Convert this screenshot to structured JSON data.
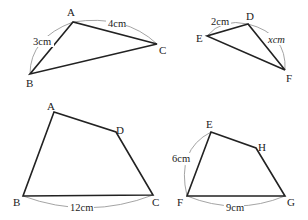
{
  "figures": [
    {
      "id": "triangle-abc",
      "type": "triangle",
      "vertices": [
        {
          "name": "A",
          "x": 73,
          "y": 22,
          "lx": 66,
          "ly": 14
        },
        {
          "name": "B",
          "x": 30,
          "y": 74,
          "lx": 25,
          "ly": 87
        },
        {
          "name": "C",
          "x": 157,
          "y": 44,
          "lx": 160,
          "ly": 53
        }
      ],
      "measures": [
        {
          "text": "3cm",
          "x": 31,
          "y": 45,
          "edge": "AB"
        },
        {
          "text": "4cm",
          "x": 108,
          "y": 28,
          "edge": "AC"
        }
      ]
    },
    {
      "id": "triangle-def",
      "type": "triangle",
      "vertices": [
        {
          "name": "D",
          "x": 248,
          "y": 24,
          "lx": 246,
          "ly": 20
        },
        {
          "name": "E",
          "x": 207,
          "y": 36,
          "lx": 196,
          "ly": 42
        },
        {
          "name": "F",
          "x": 285,
          "y": 70,
          "lx": 287,
          "ly": 81
        }
      ],
      "measures": [
        {
          "text": "2cm",
          "x": 212,
          "y": 24,
          "edge": "ED"
        },
        {
          "text": "xcm",
          "x": 269,
          "y": 43,
          "edge": "DF"
        }
      ]
    },
    {
      "id": "quadrilateral-abcd",
      "type": "quadrilateral",
      "vertices": [
        {
          "name": "A",
          "x": 54,
          "y": 112,
          "lx": 47,
          "ly": 110
        },
        {
          "name": "B",
          "x": 23,
          "y": 196,
          "lx": 13,
          "ly": 206
        },
        {
          "name": "C",
          "x": 153,
          "y": 195,
          "lx": 153,
          "ly": 206
        },
        {
          "name": "D",
          "x": 116,
          "y": 132,
          "lx": 116,
          "ly": 132
        }
      ],
      "measures": [
        {
          "text": "12cm",
          "x": 71,
          "y": 210,
          "edge": "BC"
        }
      ]
    },
    {
      "id": "quadrilateral-efgh",
      "type": "quadrilateral",
      "vertices": [
        {
          "name": "E",
          "x": 211,
          "y": 132,
          "lx": 206,
          "ly": 128
        },
        {
          "name": "F",
          "x": 187,
          "y": 196,
          "lx": 177,
          "ly": 206
        },
        {
          "name": "G",
          "x": 285,
          "y": 196,
          "lx": 288,
          "ly": 206
        },
        {
          "name": "H",
          "x": 256,
          "y": 148,
          "lx": 258,
          "ly": 149
        }
      ],
      "measures": [
        {
          "text": "6cm",
          "x": 172,
          "y": 162,
          "edge": "EF"
        },
        {
          "text": "9cm",
          "x": 226,
          "y": 210,
          "edge": "FG"
        }
      ]
    }
  ]
}
